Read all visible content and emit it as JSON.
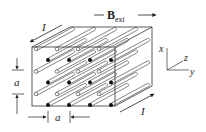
{
  "diagram": {
    "labels": {
      "current_top": "I",
      "current_bottom": "I",
      "field_main": "B",
      "field_sub": "ext",
      "spacing_vertical": "a",
      "spacing_horizontal": "a",
      "axis_x": "x",
      "axis_y": "y",
      "axis_z": "z"
    },
    "grid": {
      "filled_rows": 3,
      "filled_cols": 4,
      "hollow_rows": 3,
      "hollow_cols": 4
    },
    "colors": {
      "line": "#333333",
      "rod_fill": "#ffffff",
      "dot_filled": "#111111"
    }
  }
}
